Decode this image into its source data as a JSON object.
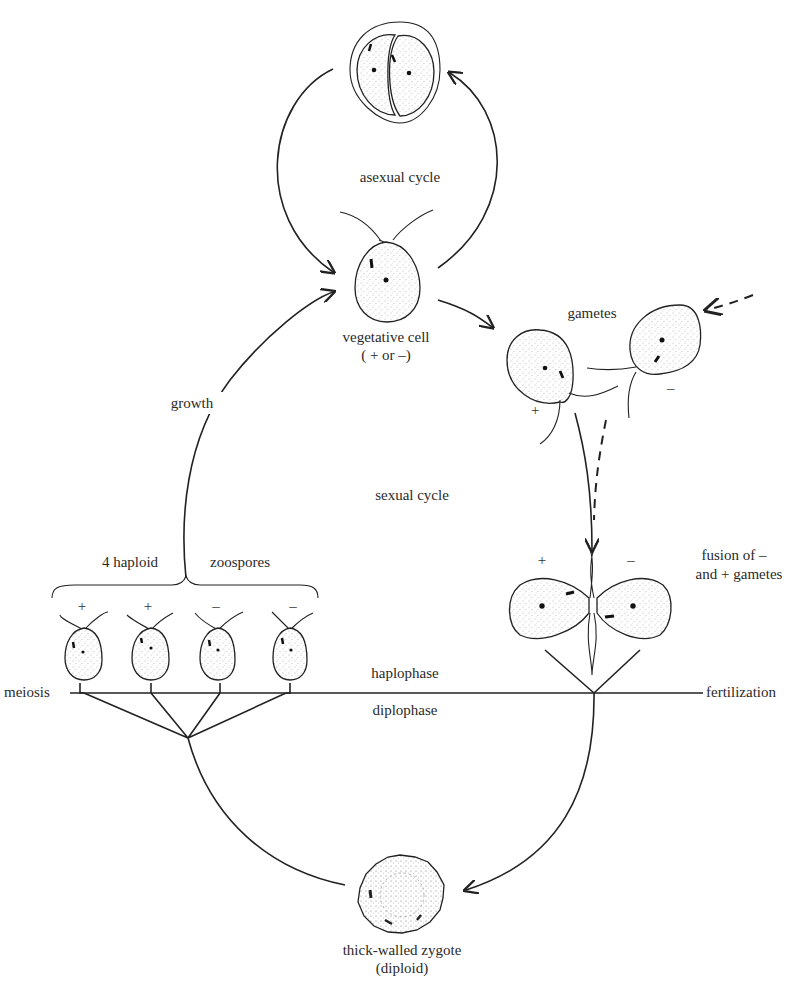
{
  "diagram": {
    "stages": {
      "asexual_division": {
        "label": ""
      },
      "asexual_cycle": {
        "label": "asexual cycle"
      },
      "vegetative_cell": {
        "label": "vegetative cell",
        "sublabel": "( + or –)"
      },
      "gametes": {
        "label": "gametes",
        "plus": "+",
        "minus": "–"
      },
      "growth": {
        "label": "growth"
      },
      "sexual_cycle": {
        "label": "sexual  cycle"
      },
      "zoospores": {
        "label_left": "4 haploid",
        "label_right": "zoospores",
        "signs": [
          "+",
          "+",
          "–",
          "–"
        ]
      },
      "fusion": {
        "label_line1": "fusion of –",
        "label_line2": "and + gametes",
        "plus": "+",
        "minus": "–"
      },
      "meiosis": {
        "label": "meiosis"
      },
      "fertilization": {
        "label": "fertilization"
      },
      "haplophase": {
        "label": "haplophase"
      },
      "diplophase": {
        "label": "diplophase"
      },
      "zygote": {
        "label": "thick-walled zygote",
        "sublabel": "(diploid)"
      }
    },
    "colors": {
      "ink": "#222222",
      "background": "#ffffff"
    }
  }
}
